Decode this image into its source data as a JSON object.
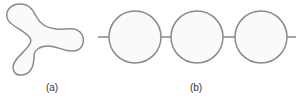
{
  "figure": {
    "stroke_color": "#8a8a8a",
    "fill_color": "#fafafa",
    "panels": [
      {
        "id": "a",
        "label": "(a)",
        "shape": "three-lobed closed curve (trefoil-like)"
      },
      {
        "id": "b",
        "label": "(b)",
        "shape": "three circles threaded on a horizontal line",
        "circle_count": 3
      }
    ]
  }
}
